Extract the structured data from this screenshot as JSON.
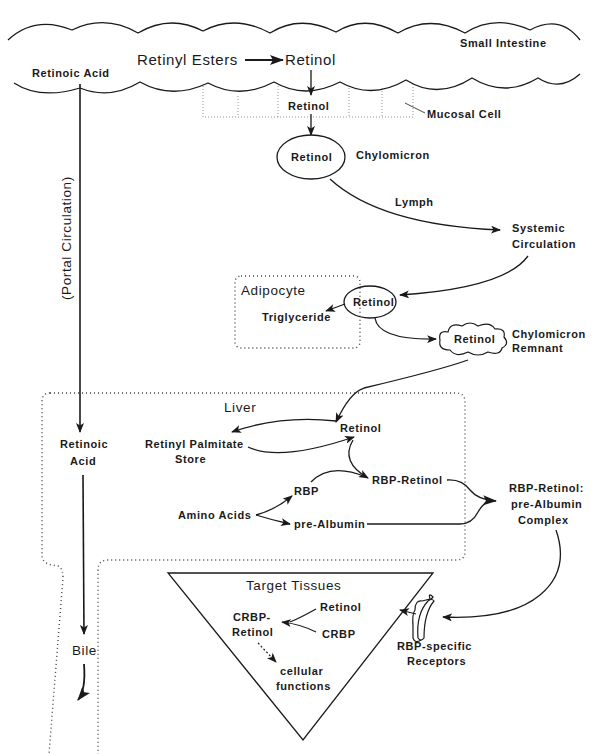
{
  "diagram": {
    "intestine": {
      "region_label": "Small Intestine",
      "retinoic_acid": "Retinoic Acid",
      "retinyl_esters": "Retinyl Esters",
      "retinol": "Retinol",
      "mucosal_retinol": "Retinol",
      "mucosal_cell": "Mucosal Cell"
    },
    "chylomicron": {
      "inner": "Retinol",
      "label": "Chylomicron"
    },
    "lymph": "Lymph",
    "systemic": {
      "line1": "Systemic",
      "line2": "Circulation"
    },
    "adipocyte": {
      "label": "Adipocyte",
      "retinol": "Retinol",
      "triglyceride": "Triglyceride"
    },
    "remnant": {
      "inner": "Retinol",
      "line1": "Chylomicron",
      "line2": "Remnant"
    },
    "portal": "(Portal Circulation)",
    "liver": {
      "label": "Liver",
      "retinoic_acid_line1": "Retinoic",
      "retinoic_acid_line2": "Acid",
      "retinol": "Retinol",
      "palmitate_line1": "Retinyl Palmitate",
      "palmitate_line2": "Store",
      "rbp_retinol": "RBP-Retinol",
      "rbp": "RBP",
      "amino_acids": "Amino Acids",
      "prealbumin": "pre-Albumin"
    },
    "complex": {
      "line1": "RBP-Retinol:",
      "line2": "pre-Albumin",
      "line3": "Complex"
    },
    "bile": "Bile",
    "target": {
      "label": "Target Tissues",
      "retinol": "Retinol",
      "crbp": "CRBP",
      "crbp_retinol_line1": "CRBP-",
      "crbp_retinol_line2": "Retinol",
      "cellular_line1": "cellular",
      "cellular_line2": "functions"
    },
    "receptors": {
      "line1": "RBP-specific",
      "line2": "Receptors"
    }
  }
}
